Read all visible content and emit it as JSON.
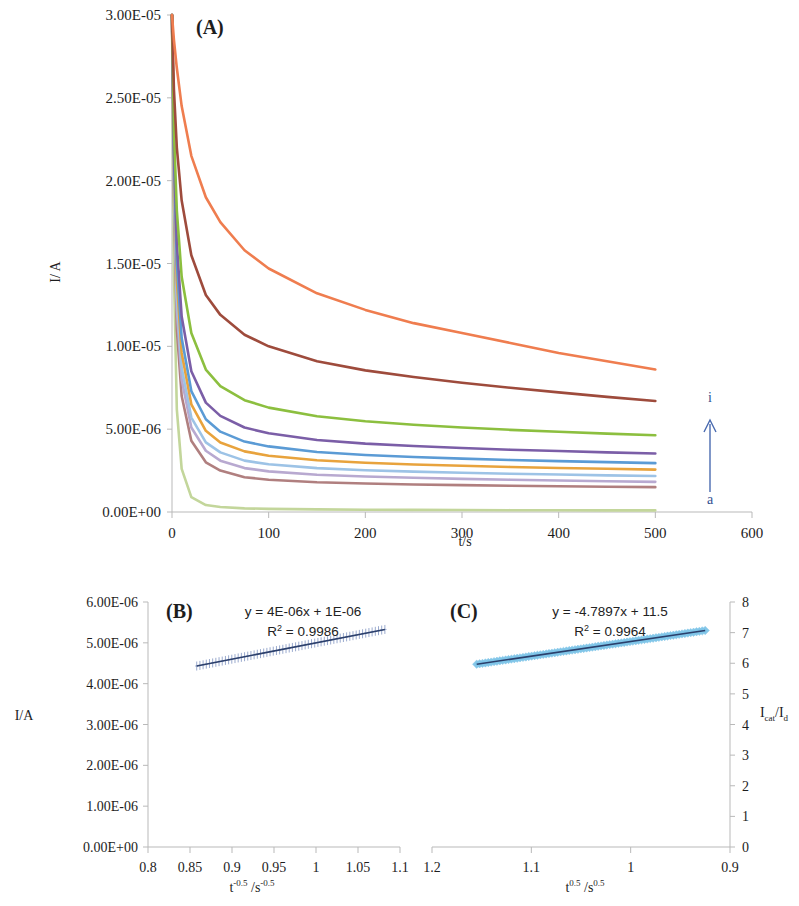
{
  "figure": {
    "panels": [
      "(A)",
      "(B)",
      "(C)"
    ]
  },
  "panelA": {
    "label": "(A)",
    "ylabel": "I/ A",
    "xlabel": "t/s",
    "y_ticks": [
      "0.00E+00",
      "5.00E-06",
      "1.00E-05",
      "1.50E-05",
      "2.00E-05",
      "2.50E-05",
      "3.00E-05"
    ],
    "x_ticks": [
      "0",
      "100",
      "200",
      "300",
      "400",
      "500",
      "600"
    ],
    "arrow_top_label": "i",
    "arrow_bottom_label": "a"
  },
  "panelB": {
    "label": "(B)",
    "ylabel": "I/A",
    "xlabel_base": "t",
    "xlabel_sup1": "-0.5",
    "xlabel_mid": "/s",
    "xlabel_sup2": "-0.5",
    "equation": "y = 4E-06x + 1E-06",
    "r_squared_prefix": "R",
    "r_squared_sup": "2",
    "r_squared_value": "= 0.9986",
    "y_ticks": [
      "0.00E+00",
      "1.00E-06",
      "2.00E-06",
      "3.00E-06",
      "4.00E-06",
      "5.00E-06",
      "6.00E-06"
    ],
    "x_ticks": [
      "0.8",
      "0.85",
      "0.9",
      "0.95",
      "1",
      "1.05",
      "1.1"
    ]
  },
  "panelC": {
    "label": "(C)",
    "ylabel_base": "I",
    "ylabel_sub1": "cat",
    "ylabel_mid": "/I",
    "ylabel_sub2": "d",
    "xlabel_base": "t",
    "xlabel_sup1": "0.5",
    "xlabel_mid": "/s",
    "xlabel_sup2": "0.5",
    "equation": "y = -4.7897x + 11.5",
    "r_squared_prefix": "R",
    "r_squared_sup": "2",
    "r_squared_value": "= 0.9964",
    "y_ticks": [
      "0",
      "1",
      "2",
      "3",
      "4",
      "5",
      "6",
      "7",
      "8"
    ],
    "x_ticks": [
      "1.2",
      "1.1",
      "1",
      "0.9"
    ]
  },
  "chart_data": [
    {
      "type": "line",
      "panel": "A",
      "title": "(A)",
      "xlabel": "t/s",
      "ylabel": "I/ A",
      "xlim": [
        0,
        600
      ],
      "ylim": [
        0,
        3e-05
      ],
      "grid": false,
      "legend": "arrow a to i",
      "note": "Chronoamperograms: current decay vs time for nine concentrations, labelled a (lowest plateau) to i (highest plateau).",
      "x": [
        0,
        2,
        5,
        10,
        20,
        35,
        50,
        75,
        100,
        150,
        200,
        250,
        300,
        350,
        400,
        450,
        500
      ],
      "series": [
        {
          "name": "a",
          "color": "#c3d69b",
          "values": [
            3e-05,
            1.45e-05,
            6.2e-06,
            2.6e-06,
            9e-07,
            4.2e-07,
            3e-07,
            2.2e-07,
            1.9e-07,
            1.6e-07,
            1.4e-07,
            1.3e-07,
            1.2e-07,
            1.1e-07,
            1.05e-07,
            1e-07,
            1e-07
          ]
        },
        {
          "name": "b",
          "color": "#b07f7f",
          "values": [
            3e-05,
            1.9e-05,
            1.1e-05,
            7e-06,
            4.3e-06,
            3e-06,
            2.5e-06,
            2.1e-06,
            1.95e-06,
            1.8e-06,
            1.72e-06,
            1.66e-06,
            1.62e-06,
            1.58e-06,
            1.55e-06,
            1.52e-06,
            1.5e-06
          ]
        },
        {
          "name": "c",
          "color": "#b8a9d0",
          "values": [
            3e-05,
            2e-05,
            1.22e-05,
            8e-06,
            5.1e-06,
            3.7e-06,
            3.1e-06,
            2.65e-06,
            2.45e-06,
            2.25e-06,
            2.14e-06,
            2.07e-06,
            2e-06,
            1.95e-06,
            1.9e-06,
            1.86e-06,
            1.82e-06
          ]
        },
        {
          "name": "d",
          "color": "#9dc3e6",
          "values": [
            3e-05,
            2.05e-05,
            1.3e-05,
            8.7e-06,
            5.7e-06,
            4.2e-06,
            3.6e-06,
            3.1e-06,
            2.88e-06,
            2.65e-06,
            2.52e-06,
            2.44e-06,
            2.37e-06,
            2.31e-06,
            2.26e-06,
            2.21e-06,
            2.17e-06
          ]
        },
        {
          "name": "e",
          "color": "#e8a33d",
          "values": [
            3e-05,
            2.1e-05,
            1.4e-05,
            9.6e-06,
            6.5e-06,
            4.9e-06,
            4.2e-06,
            3.66e-06,
            3.4e-06,
            3.12e-06,
            2.97e-06,
            2.87e-06,
            2.79e-06,
            2.72e-06,
            2.66e-06,
            2.61e-06,
            2.56e-06
          ]
        },
        {
          "name": "f",
          "color": "#5b9bd5",
          "values": [
            3e-05,
            2.15e-05,
            1.5e-05,
            1.05e-05,
            7.3e-06,
            5.6e-06,
            4.85e-06,
            4.25e-06,
            3.96e-06,
            3.62e-06,
            3.44e-06,
            3.32e-06,
            3.22e-06,
            3.14e-06,
            3.07e-06,
            3.01e-06,
            2.95e-06
          ]
        },
        {
          "name": "g",
          "color": "#7b5ea7",
          "values": [
            3e-05,
            2.2e-05,
            1.62e-05,
            1.18e-05,
            8.5e-06,
            6.6e-06,
            5.8e-06,
            5.1e-06,
            4.75e-06,
            4.35e-06,
            4.13e-06,
            3.98e-06,
            3.86e-06,
            3.76e-06,
            3.68e-06,
            3.6e-06,
            3.53e-06
          ]
        },
        {
          "name": "h",
          "color": "#8cbf3f",
          "values": [
            3e-05,
            2.3e-05,
            1.82e-05,
            1.42e-05,
            1.08e-05,
            8.6e-06,
            7.6e-06,
            6.75e-06,
            6.3e-06,
            5.78e-06,
            5.48e-06,
            5.27e-06,
            5.1e-06,
            4.96e-06,
            4.84e-06,
            4.73e-06,
            4.63e-06
          ]
        },
        {
          "name": "i-brown",
          "color": "#9e4b3c",
          "values": [
            3e-05,
            2.55e-05,
            2.2e-05,
            1.88e-05,
            1.55e-05,
            1.31e-05,
            1.19e-05,
            1.07e-05,
            1e-05,
            9.1e-06,
            8.55e-06,
            8.15e-06,
            7.8e-06,
            7.5e-06,
            7.22e-06,
            6.95e-06,
            6.7e-06
          ]
        },
        {
          "name": "i",
          "color": "#ef7d4f",
          "values": [
            3e-05,
            2.85e-05,
            2.68e-05,
            2.45e-05,
            2.15e-05,
            1.9e-05,
            1.75e-05,
            1.58e-05,
            1.47e-05,
            1.32e-05,
            1.22e-05,
            1.14e-05,
            1.08e-05,
            1.02e-05,
            9.6e-06,
            9.1e-06,
            8.6e-06
          ]
        }
      ]
    },
    {
      "type": "scatter",
      "panel": "B",
      "title": "(B)",
      "xlabel": "t^-0.5 /s^-0.5",
      "ylabel": "I/A",
      "xlim": [
        0.8,
        1.1
      ],
      "ylim": [
        0,
        6e-06
      ],
      "grid": false,
      "fit": {
        "slope": 4e-06,
        "intercept": 1e-06,
        "equation": "y = 4E-06x + 1E-06",
        "r2": 0.9986
      },
      "x_range_data": [
        0.858,
        1.082
      ],
      "y_range_data": [
        4.22e-06,
        5.06e-06
      ],
      "n_points": 60,
      "marker": "cross",
      "marker_color": "#8fa0c8",
      "line_color": "#2b3f6b"
    },
    {
      "type": "scatter",
      "panel": "C",
      "title": "(C)",
      "xlabel": "t^0.5 /s^0.5",
      "ylabel": "Icat/Id",
      "xlim": [
        1.2,
        0.9
      ],
      "ylim": [
        0,
        8
      ],
      "grid": false,
      "x_reversed": true,
      "fit": {
        "slope": -4.7897,
        "intercept": 11.5,
        "equation": "y = -4.7897x + 11.5",
        "r2": 0.9964
      },
      "x_range_data": [
        1.155,
        0.925
      ],
      "y_range_data": [
        5.97,
        7.07
      ],
      "n_points": 80,
      "marker": "diamond",
      "marker_color": "#7ec5e8",
      "line_color": "#2b3f6b"
    }
  ]
}
